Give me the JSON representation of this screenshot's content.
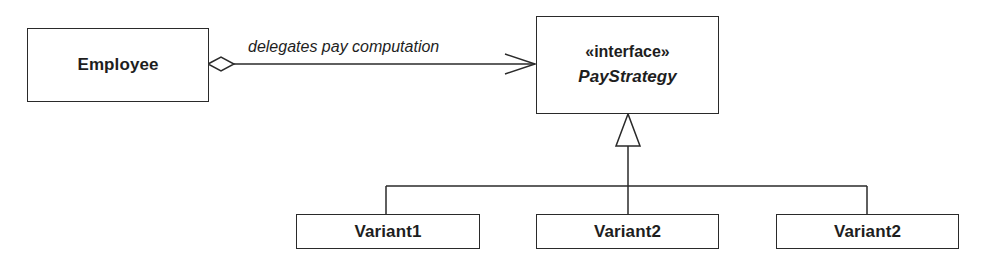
{
  "diagram": {
    "type": "UML class diagram",
    "classes": {
      "employee": {
        "name": "Employee"
      },
      "pay_strategy": {
        "stereotype": "«interface»",
        "name": "PayStrategy"
      },
      "variants": [
        {
          "name": "Variant1"
        },
        {
          "name": "Variant2"
        },
        {
          "name": "Variant2"
        }
      ]
    },
    "relationships": [
      {
        "type": "aggregation",
        "from": "Employee",
        "to": "PayStrategy",
        "label": "delegates pay computation"
      },
      {
        "type": "realization",
        "from": "Variant1",
        "to": "PayStrategy"
      },
      {
        "type": "realization",
        "from": "Variant2",
        "to": "PayStrategy"
      },
      {
        "type": "realization",
        "from": "Variant2",
        "to": "PayStrategy"
      }
    ],
    "association_label": "delegates pay computation",
    "colors": {
      "stroke": "#2a2a2a",
      "background": "#ffffff",
      "text": "#1e1e1e"
    }
  }
}
